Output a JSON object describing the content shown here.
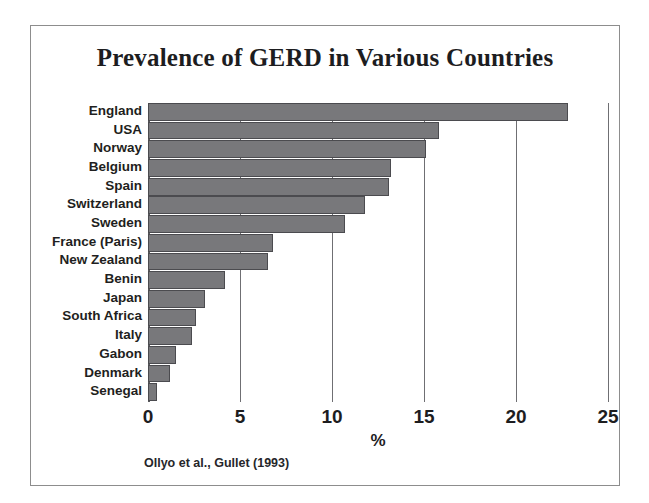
{
  "figure": {
    "title": "Prevalence of GERD in Various Countries",
    "source_note": "Ollyo et al., Gullet (1993)",
    "frame_color": "#8d8d8d",
    "background": "#ffffff"
  },
  "chart_data": {
    "type": "bar",
    "orientation": "horizontal",
    "title": "Prevalence of GERD in Various Countries",
    "subtitle": "",
    "xlabel": "%",
    "ylabel": "",
    "xlim": [
      0,
      25
    ],
    "xticks": [
      0,
      5,
      10,
      15,
      20,
      25
    ],
    "xtick_labels": [
      "0",
      "5",
      "10",
      "15",
      "20",
      "25"
    ],
    "grid": true,
    "grid_axis": "x",
    "legend": false,
    "legend_position": "none",
    "bar_color": "#78787b",
    "bar_edge_color": "#4b4b4f",
    "annotation": "Ollyo et al., Gullet (1993)",
    "categories": [
      "England",
      "USA",
      "Norway",
      "Belgium",
      "Spain",
      "Switzerland",
      "Sweden",
      "France (Paris)",
      "New Zealand",
      "Benin",
      "Japan",
      "South Africa",
      "Italy",
      "Gabon",
      "Denmark",
      "Senegal"
    ],
    "values": [
      22.8,
      15.8,
      15.1,
      13.2,
      13.1,
      11.8,
      10.7,
      6.8,
      6.5,
      4.2,
      3.1,
      2.6,
      2.4,
      1.5,
      1.2,
      0.5
    ]
  }
}
